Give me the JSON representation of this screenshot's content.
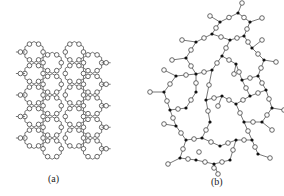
{
  "figure": {
    "panels": [
      {
        "id": "a",
        "label": "(a)",
        "description": "Ordered crystalline network (honeycomb of rings)",
        "lattice": {
          "origin_x": 22,
          "origin_y": 52,
          "hex_radius": 10.5,
          "columns": 2,
          "rows": 5,
          "column_gap_x": 36,
          "row_step_y": 21.5
        }
      },
      {
        "id": "b",
        "label": "(b)",
        "description": "Random (amorphous) network",
        "si_nodes": [
          [
            220,
            22
          ],
          [
            238,
            13
          ],
          [
            250,
            22
          ],
          [
            244,
            36
          ],
          [
            230,
            40
          ],
          [
            212,
            34
          ],
          [
            196,
            42
          ],
          [
            186,
            58
          ],
          [
            196,
            74
          ],
          [
            212,
            70
          ],
          [
            222,
            56
          ],
          [
            252,
            48
          ],
          [
            264,
            60
          ],
          [
            258,
            76
          ],
          [
            242,
            80
          ],
          [
            236,
            64
          ],
          [
            176,
            76
          ],
          [
            164,
            92
          ],
          [
            170,
            110
          ],
          [
            186,
            108
          ],
          [
            196,
            92
          ],
          [
            206,
            100
          ],
          [
            222,
            96
          ],
          [
            236,
            104
          ],
          [
            250,
            96
          ],
          [
            266,
            90
          ],
          [
            272,
            108
          ],
          [
            262,
            122
          ],
          [
            244,
            122
          ],
          [
            176,
            126
          ],
          [
            186,
            140
          ],
          [
            202,
            138
          ],
          [
            210,
            122
          ],
          [
            220,
            146
          ],
          [
            236,
            140
          ],
          [
            252,
            140
          ],
          [
            258,
            154
          ],
          [
            180,
            158
          ],
          [
            196,
            160
          ],
          [
            214,
            164
          ],
          [
            230,
            160
          ]
        ],
        "edges": [
          [
            0,
            1
          ],
          [
            1,
            2
          ],
          [
            2,
            3
          ],
          [
            3,
            4
          ],
          [
            4,
            5
          ],
          [
            5,
            0
          ],
          [
            5,
            6
          ],
          [
            6,
            7
          ],
          [
            7,
            8
          ],
          [
            8,
            9
          ],
          [
            9,
            10
          ],
          [
            10,
            4
          ],
          [
            3,
            11
          ],
          [
            11,
            12
          ],
          [
            12,
            13
          ],
          [
            13,
            14
          ],
          [
            14,
            15
          ],
          [
            15,
            10
          ],
          [
            8,
            16
          ],
          [
            16,
            17
          ],
          [
            17,
            18
          ],
          [
            18,
            19
          ],
          [
            19,
            20
          ],
          [
            20,
            8
          ],
          [
            9,
            21
          ],
          [
            21,
            22
          ],
          [
            22,
            23
          ],
          [
            23,
            24
          ],
          [
            24,
            25
          ],
          [
            25,
            13
          ],
          [
            25,
            26
          ],
          [
            26,
            27
          ],
          [
            27,
            28
          ],
          [
            28,
            23
          ],
          [
            18,
            29
          ],
          [
            29,
            30
          ],
          [
            30,
            31
          ],
          [
            31,
            32
          ],
          [
            32,
            21
          ],
          [
            31,
            33
          ],
          [
            33,
            34
          ],
          [
            34,
            35
          ],
          [
            35,
            36
          ],
          [
            35,
            28
          ],
          [
            30,
            37
          ],
          [
            37,
            38
          ],
          [
            38,
            39
          ],
          [
            39,
            40
          ],
          [
            40,
            34
          ],
          [
            14,
            24
          ]
        ],
        "dangling": [
          [
            0,
            -10,
            -6
          ],
          [
            1,
            4,
            -10
          ],
          [
            2,
            12,
            -4
          ],
          [
            6,
            -14,
            -2
          ],
          [
            7,
            -14,
            2
          ],
          [
            11,
            10,
            -8
          ],
          [
            12,
            12,
            2
          ],
          [
            16,
            -12,
            -6
          ],
          [
            17,
            -14,
            0
          ],
          [
            26,
            12,
            2
          ],
          [
            27,
            10,
            8
          ],
          [
            29,
            -12,
            -2
          ],
          [
            36,
            12,
            4
          ],
          [
            37,
            -12,
            6
          ],
          [
            39,
            4,
            10
          ],
          [
            22,
            -4,
            10
          ],
          [
            15,
            -2,
            10
          ]
        ],
        "isolated_o": [
          [
            214,
            186
          ],
          [
            199,
            170
          ]
        ]
      }
    ],
    "colors": {
      "bond": "#555555",
      "o_fill": "#ffffff",
      "o_stroke": "#444444",
      "si_fill": "#111111"
    }
  }
}
